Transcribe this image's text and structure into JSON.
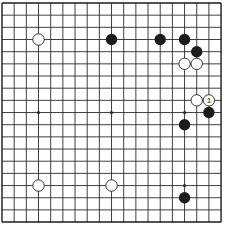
{
  "board": {
    "size": 19,
    "origin_x": 2,
    "origin_y": 3,
    "spacing": 12.17,
    "line_color": "#2a2a2a",
    "border_color": "#1a1a1a",
    "background": "#ffffff",
    "star_points": [
      [
        4,
        4
      ],
      [
        10,
        4
      ],
      [
        16,
        4
      ],
      [
        4,
        10
      ],
      [
        10,
        10
      ],
      [
        16,
        10
      ],
      [
        4,
        16
      ],
      [
        10,
        16
      ],
      [
        16,
        16
      ]
    ]
  },
  "stones": [
    {
      "color": "white",
      "col": 4,
      "row": 4
    },
    {
      "color": "black",
      "col": 10,
      "row": 4
    },
    {
      "color": "black",
      "col": 14,
      "row": 4
    },
    {
      "color": "black",
      "col": 16,
      "row": 4
    },
    {
      "color": "black",
      "col": 17,
      "row": 5
    },
    {
      "color": "white",
      "col": 16,
      "row": 6
    },
    {
      "color": "white",
      "col": 17,
      "row": 6
    },
    {
      "color": "white",
      "col": 17,
      "row": 9
    },
    {
      "color": "white",
      "col": 18,
      "row": 9,
      "label": "1"
    },
    {
      "color": "black",
      "col": 18,
      "row": 10
    },
    {
      "color": "black",
      "col": 16,
      "row": 11
    },
    {
      "color": "white",
      "col": 4,
      "row": 16
    },
    {
      "color": "white",
      "col": 10,
      "row": 16
    },
    {
      "color": "black",
      "col": 16,
      "row": 17
    }
  ],
  "colors": {
    "black_stone": "#1c1c1c",
    "white_stone_fill": "#ffffff",
    "white_stone_stroke": "#222222"
  }
}
